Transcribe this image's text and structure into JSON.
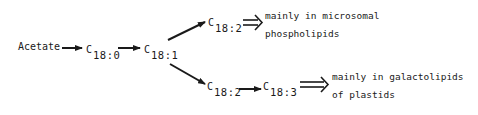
{
  "diagram": {
    "type": "biochemical-pathway",
    "nodes": {
      "acetate": "Acetate",
      "c18_0": {
        "base": "C",
        "sub": "18:0"
      },
      "c18_1": {
        "base": "C",
        "sub": "18:1"
      },
      "c18_2_upper": {
        "base": "C",
        "sub": "18:2"
      },
      "c18_2_lower": {
        "base": "C",
        "sub": "18:2"
      },
      "c18_3": {
        "base": "C",
        "sub": "18:3"
      }
    },
    "notes": {
      "upper": {
        "line1": "mainly in microsomal",
        "line2": "phospholipids"
      },
      "lower": {
        "line1": "mainly in galactolipids",
        "line2": "of plastids"
      }
    },
    "edges": [
      {
        "from": "Acetate",
        "to": "C18:0",
        "style": "single-arrow"
      },
      {
        "from": "C18:0",
        "to": "C18:1",
        "style": "single-arrow"
      },
      {
        "from": "C18:1",
        "to": "C18:2 (upper)",
        "style": "single-arrow"
      },
      {
        "from": "C18:1",
        "to": "C18:2 (lower)",
        "style": "single-arrow"
      },
      {
        "from": "C18:2 (lower)",
        "to": "C18:3",
        "style": "single-arrow"
      },
      {
        "from": "C18:2 (upper)",
        "to": "microsomal phospholipids note",
        "style": "double-arrow"
      },
      {
        "from": "C18:3",
        "to": "galactolipids note",
        "style": "double-arrow"
      }
    ],
    "colors": {
      "ink": "#1a1a1a",
      "background": "#ffffff"
    }
  }
}
